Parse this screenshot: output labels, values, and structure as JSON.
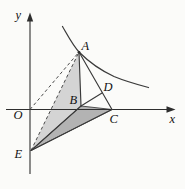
{
  "figure": {
    "type": "geometry-diagram",
    "colors": {
      "background": "#fbfbf9",
      "axis": "#2e2e2e",
      "line": "#3a3a3a",
      "dashed": "#4a4a4a",
      "light_fill": "#d4d4d4",
      "dark_fill": "#b3b3b3",
      "label": "#111111"
    },
    "labels": {
      "origin": "O",
      "x_axis": "x",
      "y_axis": "y",
      "A": "A",
      "B": "B",
      "C": "C",
      "D": "D",
      "E": "E"
    },
    "label_pos": {
      "origin": {
        "x": 13.5,
        "y": 118.5
      },
      "x_axis": {
        "x": 169.5,
        "y": 122.5
      },
      "y_axis": {
        "x": 15.5,
        "y": 18.5
      },
      "A": {
        "x": 81.5,
        "y": 49.5
      },
      "B": {
        "x": 69.5,
        "y": 104
      },
      "C": {
        "x": 109.5,
        "y": 122.5
      },
      "D": {
        "x": 103.5,
        "y": 90.5
      },
      "E": {
        "x": 14.5,
        "y": 157.5
      }
    },
    "geometry": {
      "x_axis": {
        "x1": 6,
        "y1": 109.5,
        "x2": 168.5,
        "y2": 109.5
      },
      "x_arrow": {
        "points": "175.5,109.5 166.5,106.2 166.5,112.8"
      },
      "y_axis": {
        "x1": 30,
        "y1": 174,
        "x2": 30,
        "y2": 20
      },
      "y_arrow": {
        "points": "30,12.5 26.8,21.5 33.2,21.5"
      },
      "curve_path": {
        "d": "M 62.5,26.5 C 68,36 73.5,46.5 79.5,52.5 C 88,61 100,70 114,76.5 C 126,81.5 139,85 148.5,87.5"
      },
      "triangle_ABE": {
        "points": "79,52 81,106 31,150.5"
      },
      "triangle_BCE": {
        "points": "81,106 112,109.5 31,150.5"
      },
      "seg_AB": {
        "x1": 79,
        "y1": 52,
        "x2": 81,
        "y2": 106
      },
      "seg_AC": {
        "x1": 79,
        "y1": 52,
        "x2": 112,
        "y2": 109.5
      },
      "seg_BD": {
        "x1": 81,
        "y1": 106,
        "x2": 102,
        "y2": 93
      },
      "seg_EB": {
        "x1": 31,
        "y1": 150.5,
        "x2": 81,
        "y2": 106
      },
      "seg_EC": {
        "x1": 31,
        "y1": 150.5,
        "x2": 112,
        "y2": 109.5
      },
      "dash_OA": {
        "x1": 30,
        "y1": 109.5,
        "x2": 79,
        "y2": 52
      },
      "dash_EA": {
        "x1": 31,
        "y1": 150.5,
        "x2": 79,
        "y2": 52
      },
      "dot_A": {
        "cx": 79,
        "cy": 52.3,
        "r": 1.4
      }
    }
  }
}
